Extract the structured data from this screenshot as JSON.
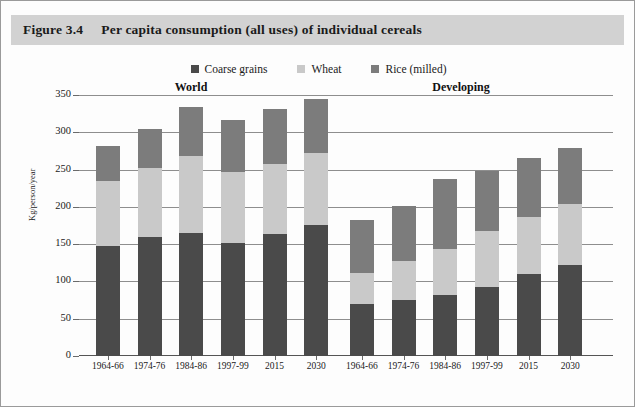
{
  "figure": {
    "number": "Figure 3.4",
    "title": "Per capita consumption (all uses) of individual cereals"
  },
  "chart_data": {
    "type": "bar",
    "stacked": true,
    "title": "Per capita consumption (all uses) of individual cereals",
    "xlabel": "",
    "ylabel": "Kg/person/year",
    "ylim": [
      0,
      350
    ],
    "yticks": [
      0,
      50,
      100,
      150,
      200,
      250,
      300,
      350
    ],
    "grid": true,
    "legend_position": "top-center",
    "legend": [
      "Coarse grains",
      "Wheat",
      "Rice (milled)"
    ],
    "colors": {
      "coarse_grains": "#4a4a4a",
      "wheat": "#c9c9c9",
      "rice_milled": "#7c7c7c",
      "title_band": "#d2d2d2"
    },
    "panels": [
      {
        "name": "World",
        "categories": [
          "1964-66",
          "1974-76",
          "1984-86",
          "1997-99",
          "2015",
          "2030"
        ],
        "series": [
          {
            "name": "Coarse grains",
            "values": [
              148,
              160,
              165,
              152,
              164,
              176
            ]
          },
          {
            "name": "Wheat",
            "values": [
              87,
              92,
              103,
              95,
              93,
              96
            ]
          },
          {
            "name": "Rice (milled)",
            "values": [
              47,
              52,
              66,
              70,
              74,
              73
            ]
          }
        ],
        "totals": [
          282,
          304,
          334,
          317,
          331,
          345
        ]
      },
      {
        "name": "Developing",
        "categories": [
          "1964-66",
          "1974-76",
          "1984-86",
          "1997-99",
          "2015",
          "2030"
        ],
        "series": [
          {
            "name": "Coarse grains",
            "values": [
              70,
              75,
              82,
              93,
              110,
              122
            ]
          },
          {
            "name": "Wheat",
            "values": [
              42,
              53,
              61,
              75,
              77,
              82
            ]
          },
          {
            "name": "Rice (milled)",
            "values": [
              71,
              73,
              94,
              80,
              79,
              75
            ]
          }
        ],
        "totals": [
          183,
          201,
          237,
          248,
          266,
          279
        ]
      }
    ]
  },
  "legend": {
    "items": [
      {
        "label": "Coarse grains",
        "color": "#4a4a4a",
        "key": "coarse"
      },
      {
        "label": "Wheat",
        "color": "#c9c9c9",
        "key": "wheat"
      },
      {
        "label": "Rice (milled)",
        "color": "#7c7c7c",
        "key": "rice"
      }
    ]
  },
  "panels_headings": {
    "world": "World",
    "developing": "Developing"
  },
  "axis": {
    "y_title": "Kg/person/year",
    "y_ticks": [
      "0",
      "50",
      "100",
      "150",
      "200",
      "250",
      "300",
      "350"
    ]
  }
}
